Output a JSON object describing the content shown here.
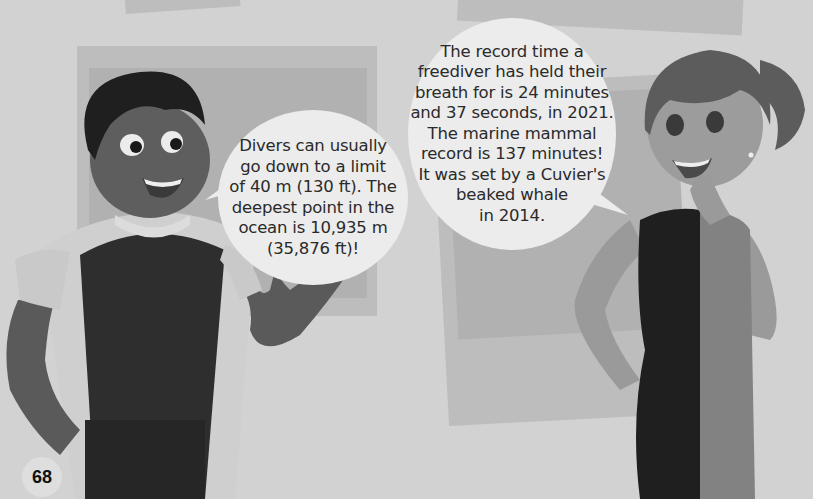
{
  "page": {
    "number": "68",
    "colors": {
      "background": "#d2d2d2",
      "panel": "#bdbdbd",
      "bubble": "#ececec",
      "text": "#2a2a2a"
    }
  },
  "speech_bubbles": [
    {
      "speaker": "boy",
      "lines": [
        "Divers can usually",
        "go down to a limit",
        "of 40 m (130 ft). The",
        "deepest point in the",
        "ocean is 10,935 m",
        "(35,876 ft)!"
      ]
    },
    {
      "speaker": "girl",
      "lines": [
        "The record time a",
        "freediver has held their",
        "breath for is 24 minutes",
        "and 37 seconds, in 2021.",
        "The marine mammal",
        "record is 137 minutes!",
        "It was set by a Cuvier's",
        "beaked whale",
        "in 2014."
      ]
    }
  ],
  "illustration": {
    "characters": [
      "boy-diver-pointing",
      "girl-diver-thinking"
    ]
  }
}
